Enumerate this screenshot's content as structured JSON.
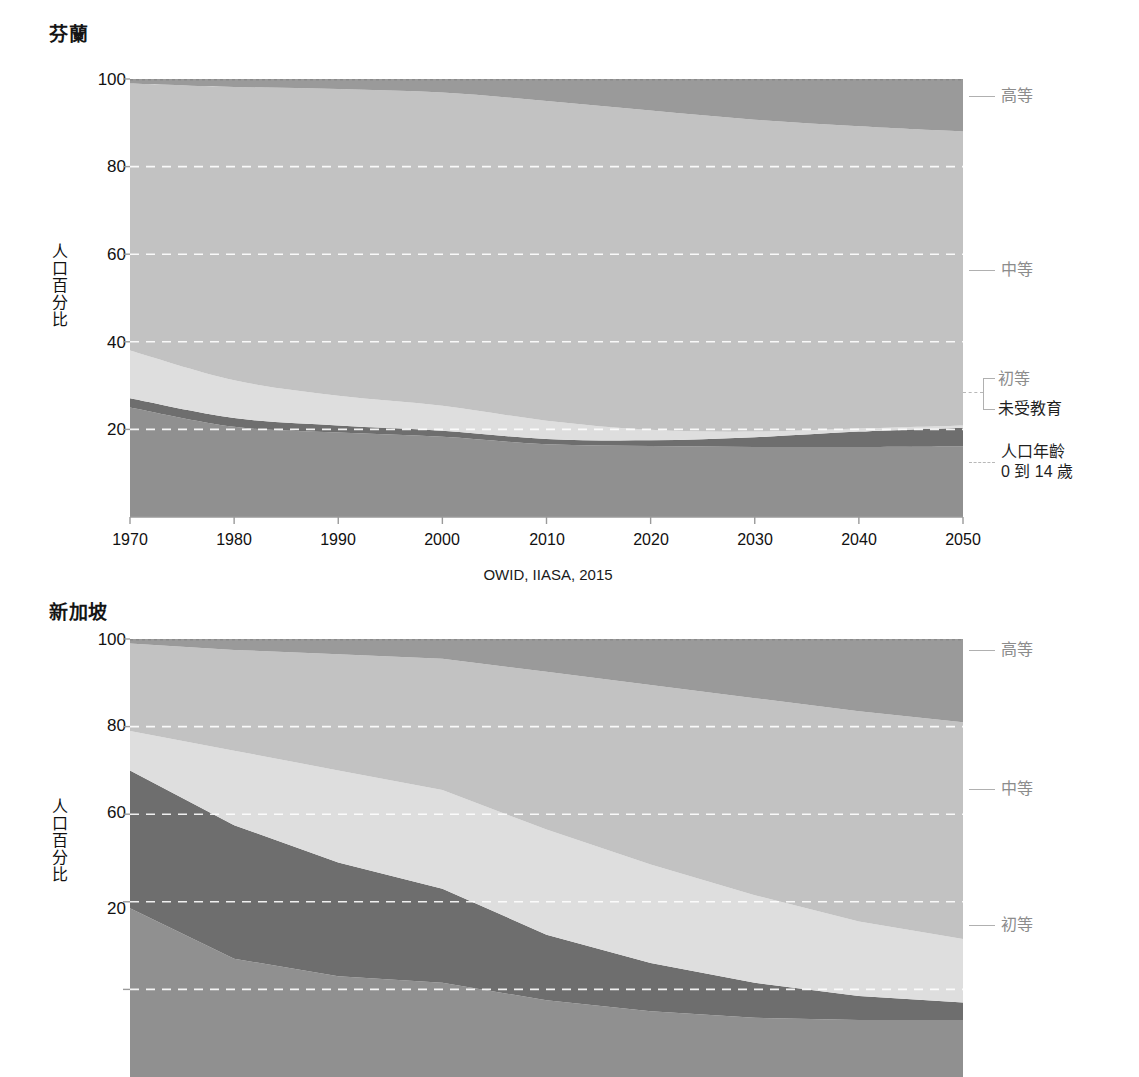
{
  "figure": {
    "source_note": "OWID, IIASA, 2015",
    "y_axis_title": "人口百分比",
    "y_ticks": [
      100,
      80,
      60,
      40,
      20
    ],
    "x_ticks": [
      1970,
      1980,
      1990,
      2000,
      2010,
      2020,
      2030,
      2040,
      2050
    ],
    "colors": {
      "tertiary": "#9a9a9a",
      "secondary": "#c2c2c2",
      "primary": "#dedede",
      "no_education": "#6e6e6e",
      "age_0_14": "#909090",
      "gridline": "#ffffff",
      "axis": "#9a9a9a",
      "label_muted": "#8c8c8c",
      "label_dark": "#1f1f1f"
    },
    "series_labels": {
      "tertiary": "高等",
      "secondary": "中等",
      "primary": "初等",
      "no_education": "未受教育",
      "age_0_14_line1": "人口年齡",
      "age_0_14_line2": "0 到 14 歲"
    }
  },
  "charts": [
    {
      "id": "finland",
      "title": "芬蘭"
    },
    {
      "id": "singapore",
      "title": "新加坡"
    }
  ],
  "chart_data": [
    {
      "type": "area",
      "stacked": true,
      "title": "芬蘭",
      "xlabel": "",
      "ylabel": "人口百分比",
      "xlim": [
        1970,
        2050
      ],
      "ylim": [
        0,
        100
      ],
      "grid": true,
      "legend_position": "right",
      "annotations": [
        "OWID, IIASA, 2015"
      ],
      "x": [
        1970,
        1980,
        1990,
        2000,
        2010,
        2020,
        2030,
        2040,
        2050
      ],
      "series": [
        {
          "name": "人口年齡 0 到 14 歲",
          "color": "#909090",
          "values": [
            25.0,
            20.6,
            19.3,
            18.3,
            16.6,
            16.2,
            16.0,
            16.0,
            16.1
          ]
        },
        {
          "name": "未受教育",
          "color": "#6e6e6e",
          "values": [
            2.1,
            2.0,
            1.6,
            1.4,
            1.2,
            1.3,
            2.2,
            3.5,
            4.3
          ]
        },
        {
          "name": "初等",
          "color": "#dedede",
          "values": [
            10.9,
            8.6,
            6.8,
            5.7,
            4.2,
            2.4,
            1.3,
            0.7,
            0.5
          ]
        },
        {
          "name": "中等",
          "color": "#c2c2c2",
          "values": [
            61.0,
            67.0,
            70.0,
            71.5,
            73.0,
            72.9,
            71.2,
            69.0,
            67.1
          ]
        },
        {
          "name": "高等",
          "color": "#9a9a9a",
          "values": [
            1.0,
            1.8,
            2.3,
            3.1,
            5.0,
            7.2,
            9.3,
            10.8,
            12.0
          ]
        }
      ],
      "boundaries_cumulative": {
        "age_0_14": [
          25.0,
          20.6,
          19.3,
          18.3,
          16.6,
          16.2,
          16.0,
          16.0,
          16.1
        ],
        "plus_no_education": [
          27.1,
          22.6,
          20.9,
          19.7,
          17.8,
          17.5,
          18.2,
          19.5,
          20.4
        ],
        "plus_primary": [
          38.0,
          31.2,
          27.7,
          25.4,
          22.0,
          19.9,
          19.5,
          20.2,
          20.9
        ],
        "plus_secondary": [
          99.0,
          98.2,
          97.7,
          96.9,
          95.0,
          92.8,
          90.7,
          89.2,
          88.0
        ],
        "total": [
          100,
          100,
          100,
          100,
          100,
          100,
          100,
          100,
          100
        ]
      }
    },
    {
      "type": "area",
      "stacked": true,
      "title": "新加坡",
      "xlabel": "",
      "ylabel": "人口百分比",
      "xlim": [
        1970,
        2050
      ],
      "ylim": [
        0,
        100
      ],
      "grid": true,
      "legend_position": "right",
      "x": [
        1970,
        1980,
        1990,
        2000,
        2010,
        2020,
        2030,
        2040,
        2050
      ],
      "series": [
        {
          "name": "人口年齡 0 到 14 歲",
          "color": "#909090",
          "values": [
            38.5,
            27.0,
            23.0,
            21.5,
            17.5,
            15.0,
            13.5,
            13.0,
            13.0
          ]
        },
        {
          "name": "未受教育",
          "color": "#6e6e6e",
          "values": [
            31.5,
            30.5,
            26.0,
            21.5,
            15.0,
            11.0,
            8.0,
            5.5,
            4.0
          ]
        },
        {
          "name": "初等",
          "color": "#dedede",
          "values": [
            9.0,
            17.0,
            21.0,
            22.5,
            24.0,
            22.5,
            20.0,
            17.0,
            14.5
          ]
        },
        {
          "name": "中等",
          "color": "#c2c2c2",
          "values": [
            20.0,
            23.0,
            26.5,
            30.0,
            36.0,
            41.0,
            45.0,
            48.0,
            49.5
          ]
        },
        {
          "name": "高等",
          "color": "#9a9a9a",
          "values": [
            1.0,
            2.5,
            3.5,
            4.5,
            7.5,
            10.5,
            13.5,
            16.5,
            19.0
          ]
        }
      ],
      "boundaries_cumulative": {
        "age_0_14": [
          38.5,
          27.0,
          23.0,
          21.5,
          17.5,
          15.0,
          13.5,
          13.0,
          13.0
        ],
        "plus_no_education": [
          70.0,
          57.5,
          49.0,
          43.0,
          32.5,
          26.0,
          21.5,
          18.5,
          17.0
        ],
        "plus_primary": [
          79.0,
          74.5,
          70.0,
          65.5,
          56.5,
          48.5,
          41.5,
          35.5,
          31.5
        ],
        "plus_secondary": [
          99.0,
          97.5,
          96.5,
          95.5,
          92.5,
          89.5,
          86.5,
          83.5,
          81.0
        ],
        "total": [
          100,
          100,
          100,
          100,
          100,
          100,
          100,
          100,
          100
        ]
      }
    }
  ]
}
